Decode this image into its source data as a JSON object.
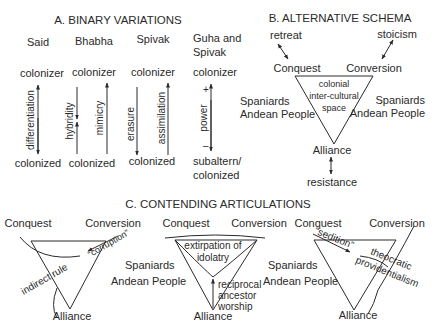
{
  "panel_a": {
    "title": "A. BINARY VARIATIONS",
    "columns": [
      {
        "author": "Said",
        "top": "colonizer",
        "bottom": "colonized",
        "labels": [
          "differentiation"
        ]
      },
      {
        "author": "Bhabha",
        "top": "colonizer",
        "bottom": "colonized",
        "labels": [
          "hybridity",
          "mimicry"
        ]
      },
      {
        "author": "Spivak",
        "top": "colonizer",
        "bottom": "colonized",
        "labels": [
          "erasure",
          "assimilation"
        ]
      },
      {
        "author_line1": "Guha and",
        "author_line2": "Spivak",
        "top": "colonizer",
        "bottom_line1": "subaltern/",
        "bottom_line2": "colonized",
        "labels": [
          "power"
        ],
        "plus": "+",
        "minus": "–"
      }
    ]
  },
  "panel_b": {
    "title": "B. ALTERNATIVE SCHEMA",
    "retreat": "retreat",
    "stoicism": "stoicism",
    "conquest": "Conquest",
    "conversion": "Conversion",
    "center_lines": [
      "colonial",
      "inter-cultural",
      "space"
    ],
    "left_lines": [
      "Spaniards",
      "Andean People"
    ],
    "right_lines": [
      "Spaniards",
      "Andean People"
    ],
    "alliance": "Alliance",
    "resistance": "resistance"
  },
  "panel_c": {
    "title": "C. CONTENDING ARTICULATIONS",
    "d1": {
      "conquest": "Conquest",
      "conversion": "Conversion",
      "alliance": "Alliance",
      "indirect_rule": "indirect rule",
      "corruption": "“corruption”"
    },
    "d2": {
      "conquest": "Conquest",
      "conversion": "Conversion",
      "alliance": "Alliance",
      "extirpation_lines": [
        "extirpation of",
        "idolatry"
      ],
      "reciprocal_lines": [
        "reciprocal",
        "ancestor",
        "worship"
      ]
    },
    "d3": {
      "conquest": "Conquest",
      "conversion": "Conversion",
      "alliance": "Alliance",
      "sedition": "“sedition”",
      "theocratic_lines": [
        "theocratic",
        "providentialism"
      ]
    },
    "mid_left_lines": [
      "Spaniards",
      "Andean People"
    ],
    "mid_right_lines": [
      "Spaniards",
      "Andean People"
    ]
  }
}
